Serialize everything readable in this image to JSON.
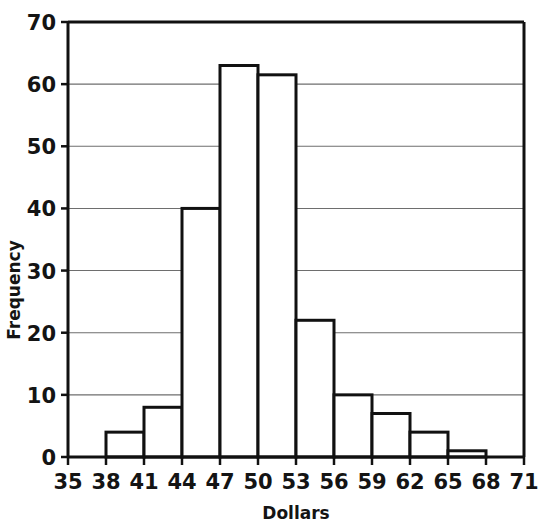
{
  "chart_data": {
    "type": "bar",
    "title": "",
    "xlabel": "Dollars",
    "ylabel": "Frequency",
    "xlim": [
      35,
      71
    ],
    "ylim": [
      0,
      70
    ],
    "grid": true,
    "legend": null,
    "bin_width": 3,
    "bin_edges": [
      35,
      38,
      41,
      44,
      47,
      50,
      53,
      56,
      59,
      62,
      65,
      68,
      71
    ],
    "categories": [
      "35-38",
      "38-41",
      "41-44",
      "44-47",
      "47-50",
      "50-53",
      "53-56",
      "56-59",
      "59-62",
      "62-65",
      "65-68",
      "68-71"
    ],
    "values": [
      0,
      4,
      8,
      40,
      63,
      61.5,
      22,
      10,
      7,
      4,
      1,
      0
    ],
    "xticks": [
      35,
      38,
      41,
      44,
      47,
      50,
      53,
      56,
      59,
      62,
      65,
      68,
      71
    ],
    "xticklabels": [
      "35",
      "38",
      "41",
      "44",
      "47",
      "50",
      "53",
      "56",
      "59",
      "62",
      "65",
      "68",
      "71"
    ],
    "yticks": [
      0,
      10,
      20,
      30,
      40,
      50,
      60,
      70
    ],
    "yticklabels": [
      "0",
      "10",
      "20",
      "30",
      "40",
      "50",
      "60",
      "70"
    ],
    "style": {
      "background": "#ffffff",
      "bar_fill": "#ffffff",
      "bar_stroke": "#111111",
      "axis_stroke": "#111111",
      "grid_stroke": "#6e6e6e",
      "text_color": "#141414"
    }
  }
}
